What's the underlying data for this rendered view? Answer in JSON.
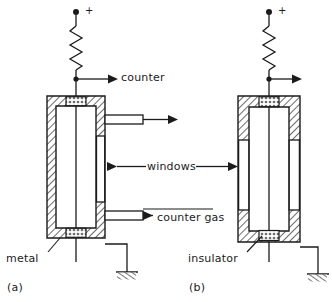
{
  "figure": {
    "stroke_color": "#1b1b1b",
    "hatch_color": "#3a3a3a",
    "background": "#ffffff"
  },
  "labels": {
    "counter": "counter",
    "windows": "windows",
    "counter_gas": "counter gas",
    "metal": "metal",
    "insulator": "insulator",
    "plus_terminal": "+",
    "panel_a": "(a)",
    "panel_b": "(b)"
  },
  "panels": [
    {
      "id": "a",
      "caption": "(a)",
      "body_material": "metal",
      "has_gas_port": true,
      "has_counter_port": true,
      "window_sides": [
        "right"
      ]
    },
    {
      "id": "b",
      "caption": "(b)",
      "body_material": "insulator",
      "has_gas_port": false,
      "has_counter_port": false,
      "window_sides": [
        "left",
        "right"
      ]
    }
  ],
  "symbols": {
    "resistor": "resistor-zigzag",
    "ground": "ground-hatched",
    "terminal_dot": "filled-circle",
    "arrow": "arrow-right"
  }
}
